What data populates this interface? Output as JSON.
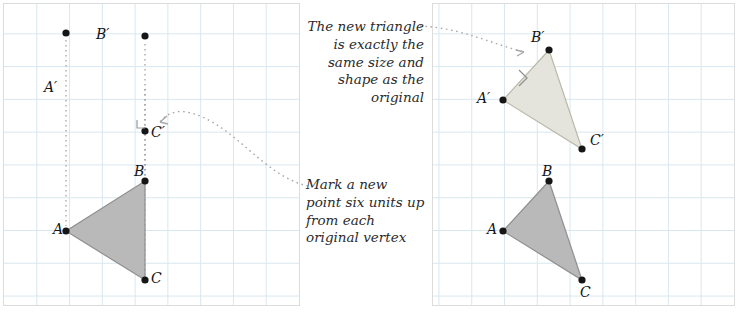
{
  "figure": {
    "panels": [
      {
        "id": "left",
        "label": "original-with-translated-points"
      },
      {
        "id": "right",
        "label": "original-and-translated-triangles"
      }
    ],
    "grid": {
      "cell_size": 33,
      "line_color": "#d9e7ef",
      "border_color": "#dcdcdc"
    },
    "colors": {
      "triangle_fill": "#b8b8b8",
      "triangle_fill_light": "#e2e2dc",
      "triangle_stroke": "#8a8a8a",
      "point": "#1a1a1a",
      "dotted": "#9a9a9a",
      "arrow": "#a6a6a6"
    }
  },
  "notes": {
    "mark_point": "Mark a new point six units up from each original vertex",
    "same_size": "The new triangle is exactly the same size and shape as the original"
  },
  "labels": {
    "left": {
      "A": "A",
      "B": "B",
      "C": "C",
      "A_prime": "A′",
      "B_prime": "B′",
      "C_prime": "C′"
    },
    "right": {
      "A": "A",
      "B": "B",
      "C": "C",
      "A_prime": "A′",
      "B_prime": "B′",
      "C_prime": "C′"
    }
  },
  "points": {
    "left": {
      "A": [
        66,
        231
      ],
      "B": [
        145,
        181
      ],
      "C": [
        145,
        280
      ],
      "A_prime": [
        66,
        33
      ],
      "B_prime": [
        145,
        -17
      ],
      "C_prime": [
        145,
        82
      ]
    },
    "right": {
      "A": [
        503,
        231
      ],
      "B": [
        549,
        181
      ],
      "C": [
        582,
        280
      ],
      "A_prime": [
        503,
        33
      ],
      "B_prime": [
        549,
        -17
      ],
      "C_prime": [
        582,
        82
      ]
    }
  }
}
